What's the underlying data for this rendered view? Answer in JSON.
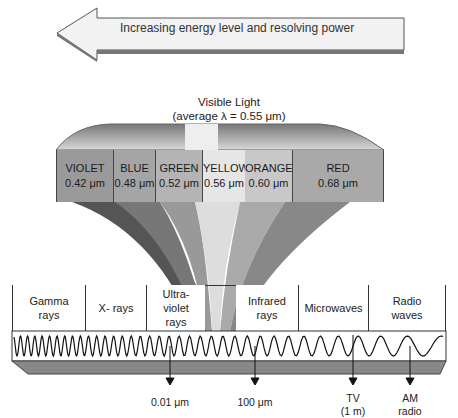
{
  "diagram": {
    "arrow": {
      "label": "Increasing energy level and resolving power",
      "direction": "left"
    },
    "visible_light": {
      "title": "Visible Light",
      "subtitle": "(average λ = 0.55 μm)",
      "bands": [
        {
          "name": "VIOLET",
          "wavelength": "0.42 μm",
          "color": "#9a9a9a"
        },
        {
          "name": "BLUE",
          "wavelength": "0.48 μm",
          "color": "#a5a5a5"
        },
        {
          "name": "GREEN",
          "wavelength": "0.52 μm",
          "color": "#b4b4b4"
        },
        {
          "name": "YELLOW",
          "wavelength": "0.56 μm",
          "color": "#e6e6e6"
        },
        {
          "name": "ORANGE",
          "wavelength": "0.60 μm",
          "color": "#c8c8c8"
        },
        {
          "name": "RED",
          "wavelength": "0.68 μm",
          "color": "#a9a9a9"
        }
      ]
    },
    "regions": [
      {
        "label": "Gamma rays"
      },
      {
        "label": "X- rays"
      },
      {
        "label": "Ultra-violet rays"
      },
      {
        "label": ""
      },
      {
        "label": "Infrared rays"
      },
      {
        "label": "Microwaves"
      },
      {
        "label": "Radio waves"
      }
    ],
    "markers": [
      {
        "label": "0.01 μm",
        "sub": ""
      },
      {
        "label": "100 μm",
        "sub": ""
      },
      {
        "label": "TV",
        "sub": "(1 m)"
      },
      {
        "label": "AM",
        "sub": "radio"
      }
    ]
  }
}
